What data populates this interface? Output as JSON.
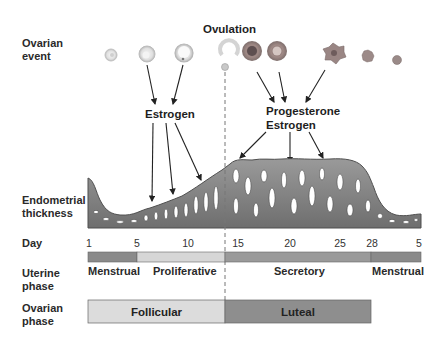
{
  "rows": {
    "ovarian_event": "Ovarian\nevent",
    "endometrial_thickness": "Endometrial\nthickness",
    "day": "Day",
    "uterine_phase": "Uterine\nphase",
    "ovarian_phase": "Ovarian\nphase"
  },
  "annotations": {
    "ovulation": "Ovulation",
    "estrogen": "Estrogen",
    "progesterone_estrogen": "Progesterone\nEstrogen"
  },
  "day_ticks": [
    {
      "label": "1",
      "x": 89
    },
    {
      "label": "5",
      "x": 137
    },
    {
      "label": "10",
      "x": 188
    },
    {
      "label": "15",
      "x": 238
    },
    {
      "label": "20",
      "x": 290
    },
    {
      "label": "25",
      "x": 340
    },
    {
      "label": "28",
      "x": 372
    },
    {
      "label": "5",
      "x": 420
    }
  ],
  "uterine_phases": [
    {
      "label": "Menstrual",
      "start_day": 1,
      "end_day": 5,
      "color": "#8a8a8a"
    },
    {
      "label": "Proliferative",
      "start_day": 5,
      "end_day": 14,
      "color": "#d6d6d6"
    },
    {
      "label": "Secretory",
      "start_day": 14,
      "end_day": 28,
      "color": "#9a9a9a"
    },
    {
      "label": "Menstrual",
      "start_day": 28,
      "end_day": 5,
      "color": "#8a8a8a"
    }
  ],
  "ovarian_phases": [
    {
      "label": "Follicular",
      "start_day": 1,
      "end_day": 14,
      "color": "#dcdcdc"
    },
    {
      "label": "Luteal",
      "start_day": 14,
      "end_day": 28,
      "color": "#8e8e8e"
    }
  ],
  "ovulation_day": 14,
  "colors": {
    "endometrium_fill": "#8c8c8c",
    "endometrium_dark": "#5a5a5a",
    "follicle_light": "#e2e2e2",
    "corpus_luteum": "#9a8a8a",
    "arrow": "#222222"
  }
}
